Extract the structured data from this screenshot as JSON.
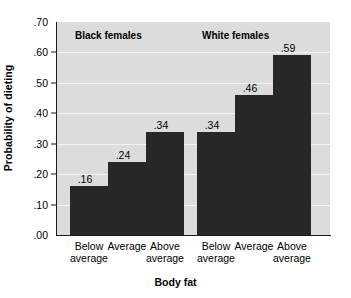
{
  "chart_data": {
    "type": "bar",
    "title": "",
    "xlabel": "Body fat",
    "ylabel": "Probability of dieting",
    "ylim": [
      0.0,
      0.7
    ],
    "grid": true,
    "legend_position": "none",
    "categories": [
      "Below average",
      "Average",
      "Above average"
    ],
    "ytick_labels": [
      ".70",
      ".60",
      ".50",
      ".40",
      ".30",
      ".20",
      ".10",
      ".00"
    ],
    "ytick_values": [
      0.7,
      0.6,
      0.5,
      0.4,
      0.3,
      0.2,
      0.1,
      0.0
    ],
    "groups": [
      {
        "name": "Black females",
        "bars": [
          {
            "category": "Below average",
            "value": 0.16,
            "label": ".16"
          },
          {
            "category": "Average",
            "value": 0.24,
            "label": ".24"
          },
          {
            "category": "Above average",
            "value": 0.34,
            "label": ".34"
          }
        ]
      },
      {
        "name": "White females",
        "bars": [
          {
            "category": "Below average",
            "value": 0.34,
            "label": ".34"
          },
          {
            "category": "Average",
            "value": 0.46,
            "label": ".46"
          },
          {
            "category": "Above average",
            "value": 0.59,
            "label": ".59"
          }
        ]
      }
    ],
    "series": [
      {
        "name": "Black females",
        "values": [
          0.16,
          0.24,
          0.34
        ]
      },
      {
        "name": "White females",
        "values": [
          0.34,
          0.46,
          0.59
        ]
      }
    ],
    "colors": {
      "bar": "#272727",
      "plot_background": "#dcdcdc",
      "gridline": "#f4f4f4",
      "axis": "#1a1a1a",
      "text": "#000000",
      "figure_background": "#ffffff"
    }
  }
}
